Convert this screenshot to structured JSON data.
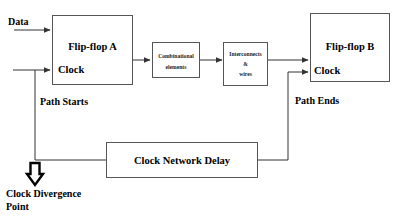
{
  "diagram": {
    "colors": {
      "box_stroke": "#555555",
      "wire": "#333333",
      "text": "#000000",
      "background": "#ffffff"
    },
    "blocks": {
      "flip_flop_a": {
        "title": "Flip-flop A",
        "clock_label": "Clock"
      },
      "combinational": {
        "line1": "Combinational",
        "line2": "elements"
      },
      "interconnects": {
        "line1": "Interconnects",
        "line2": "&",
        "line3": "wires"
      },
      "flip_flop_b": {
        "title": "Flip-flop B",
        "clock_label": "Clock"
      },
      "clock_network_delay": {
        "title": "Clock Network Delay"
      }
    },
    "labels": {
      "data": "Data",
      "path_starts": "Path Starts",
      "path_ends": "Path Ends",
      "clock_divergence_line1": "Clock Divergence",
      "clock_divergence_line2": "Point"
    },
    "icons": {
      "divergence_arrow": "down-arrow-icon"
    }
  }
}
